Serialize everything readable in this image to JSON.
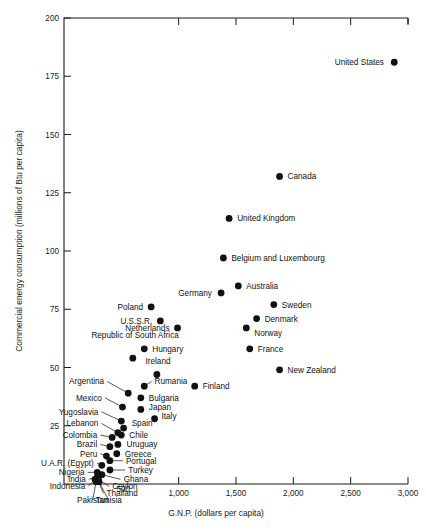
{
  "chart_data": {
    "type": "scatter",
    "title": "",
    "xlabel": "G.N.P. (dollars per capita)",
    "ylabel": "Commercial energy consumption   (millions of Btu per capita)",
    "xlim": [
      0,
      3000
    ],
    "ylim": [
      0,
      200
    ],
    "xticks": [
      500,
      1000,
      1500,
      2000,
      2500,
      3000
    ],
    "xticklabels": [
      "500",
      "1,000",
      "1,500",
      "2,000",
      "2,500",
      "3,000"
    ],
    "yticks": [
      25,
      50,
      75,
      100,
      125,
      150,
      175,
      200
    ],
    "yticklabels": [
      "25",
      "50",
      "75",
      "100",
      "125",
      "150",
      "175",
      "200"
    ],
    "grid": false,
    "legend": "none",
    "points": [
      {
        "name": "United States",
        "x": 2880,
        "y": 181,
        "lx": 2790,
        "ly": 181,
        "anchor": "end",
        "leader": false
      },
      {
        "name": "Canada",
        "x": 1880,
        "y": 132,
        "lx": 1950,
        "ly": 132,
        "anchor": "start",
        "leader": false
      },
      {
        "name": "United Kingdom",
        "x": 1440,
        "y": 114,
        "lx": 1510,
        "ly": 114,
        "anchor": "start",
        "leader": false
      },
      {
        "name": "Belgium and Luxembourg",
        "x": 1390,
        "y": 97,
        "lx": 1460,
        "ly": 97,
        "anchor": "start",
        "leader": false
      },
      {
        "name": "Australia",
        "x": 1520,
        "y": 85,
        "lx": 1590,
        "ly": 85,
        "anchor": "start",
        "leader": false
      },
      {
        "name": "Germany",
        "x": 1370,
        "y": 82,
        "lx": 1290,
        "ly": 82,
        "anchor": "end",
        "leader": false
      },
      {
        "name": "Sweden",
        "x": 1830,
        "y": 77,
        "lx": 1900,
        "ly": 77,
        "anchor": "start",
        "leader": false
      },
      {
        "name": "Poland",
        "x": 760,
        "y": 76,
        "lx": 690,
        "ly": 76,
        "anchor": "end",
        "leader": false
      },
      {
        "name": "U.S.S.R.",
        "x": 840,
        "y": 70,
        "lx": 770,
        "ly": 70,
        "anchor": "end",
        "leader": false
      },
      {
        "name": "Denmark",
        "x": 1680,
        "y": 71,
        "lx": 1750,
        "ly": 71,
        "anchor": "start",
        "leader": false
      },
      {
        "name": "Netherlands",
        "x": 990,
        "y": 67,
        "lx": 920,
        "ly": 67,
        "anchor": "end",
        "leader": false
      },
      {
        "name": "Norway",
        "x": 1590,
        "y": 67,
        "lx": 1660,
        "ly": 65,
        "anchor": "start",
        "leader": false
      },
      {
        "name": "Republic of South Africa",
        "x": 600,
        "y": 54,
        "lx": 620,
        "ly": 64,
        "anchor": "middle",
        "leader": false
      },
      {
        "name": "Hungary",
        "x": 700,
        "y": 58,
        "lx": 770,
        "ly": 58,
        "anchor": "start",
        "leader": false
      },
      {
        "name": "France",
        "x": 1620,
        "y": 58,
        "lx": 1690,
        "ly": 58,
        "anchor": "start",
        "leader": false
      },
      {
        "name": "Ireland",
        "x": 810,
        "y": 47,
        "lx": 820,
        "ly": 53,
        "anchor": "middle",
        "leader": false
      },
      {
        "name": "New Zealand",
        "x": 1880,
        "y": 49,
        "lx": 1950,
        "ly": 49,
        "anchor": "start",
        "leader": false
      },
      {
        "name": "Finland",
        "x": 1140,
        "y": 42,
        "lx": 1210,
        "ly": 42,
        "anchor": "start",
        "leader": false
      },
      {
        "name": "Rumania",
        "x": 700,
        "y": 42,
        "lx": 790,
        "ly": 44,
        "anchor": "start",
        "leader": true
      },
      {
        "name": "Bulgaria",
        "x": 670,
        "y": 37,
        "lx": 740,
        "ly": 37,
        "anchor": "start",
        "leader": false
      },
      {
        "name": "Argentina",
        "x": 560,
        "y": 39,
        "lx": 350,
        "ly": 44,
        "anchor": "end",
        "leader": true
      },
      {
        "name": "Japan",
        "x": 670,
        "y": 32,
        "lx": 740,
        "ly": 33,
        "anchor": "start",
        "leader": false
      },
      {
        "name": "Mexico",
        "x": 510,
        "y": 33,
        "lx": 330,
        "ly": 37,
        "anchor": "end",
        "leader": true
      },
      {
        "name": "Italy",
        "x": 790,
        "y": 28,
        "lx": 850,
        "ly": 29,
        "anchor": "start",
        "leader": false
      },
      {
        "name": "Yugoslavia",
        "x": 500,
        "y": 27,
        "lx": 300,
        "ly": 31,
        "anchor": "end",
        "leader": true
      },
      {
        "name": "Spain",
        "x": 520,
        "y": 24,
        "lx": 590,
        "ly": 26,
        "anchor": "start",
        "leader": false
      },
      {
        "name": "Lebanon",
        "x": 470,
        "y": 22,
        "lx": 300,
        "ly": 26,
        "anchor": "end",
        "leader": true
      },
      {
        "name": "Chile",
        "x": 500,
        "y": 21,
        "lx": 570,
        "ly": 21,
        "anchor": "start",
        "leader": false
      },
      {
        "name": "Colombia",
        "x": 420,
        "y": 20,
        "lx": 290,
        "ly": 21,
        "anchor": "end",
        "leader": true
      },
      {
        "name": "Uruguay",
        "x": 470,
        "y": 17,
        "lx": 545,
        "ly": 17,
        "anchor": "start",
        "leader": false
      },
      {
        "name": "Brazil",
        "x": 400,
        "y": 16,
        "lx": 290,
        "ly": 17,
        "anchor": "end",
        "leader": true
      },
      {
        "name": "Greece",
        "x": 460,
        "y": 13,
        "lx": 530,
        "ly": 13,
        "anchor": "start",
        "leader": false
      },
      {
        "name": "Peru",
        "x": 370,
        "y": 12,
        "lx": 290,
        "ly": 13,
        "anchor": "end",
        "leader": true
      },
      {
        "name": "Portugal",
        "x": 400,
        "y": 10,
        "lx": 540,
        "ly": 10,
        "anchor": "start",
        "leader": true
      },
      {
        "name": "U.A.R. (Egypt)",
        "x": 330,
        "y": 8,
        "lx": 260,
        "ly": 9,
        "anchor": "end",
        "leader": true
      },
      {
        "name": "Turkey",
        "x": 400,
        "y": 6,
        "lx": 560,
        "ly": 6,
        "anchor": "start",
        "leader": true
      },
      {
        "name": "Nigeria",
        "x": 290,
        "y": 5,
        "lx": 180,
        "ly": 5,
        "anchor": "end",
        "leader": true
      },
      {
        "name": "Ghana",
        "x": 330,
        "y": 4,
        "lx": 520,
        "ly": 2,
        "anchor": "start",
        "leader": true
      },
      {
        "name": "India",
        "x": 290,
        "y": 3,
        "lx": 190,
        "ly": 2,
        "anchor": "end",
        "leader": true
      },
      {
        "name": "Ceylon",
        "x": 300,
        "y": 2,
        "lx": 420,
        "ly": -1,
        "anchor": "start",
        "leader": true
      },
      {
        "name": "Indonesia",
        "x": 270,
        "y": 2,
        "lx": 185,
        "ly": -1,
        "anchor": "end",
        "leader": true
      },
      {
        "name": "Thailand",
        "x": 300,
        "y": 1,
        "lx": 370,
        "ly": -4,
        "anchor": "start",
        "leader": true
      },
      {
        "name": "Pakistan",
        "x": 280,
        "y": 1,
        "lx": 250,
        "ly": -7,
        "anchor": "middle",
        "leader": true
      },
      {
        "name": "Tunisia",
        "x": 305,
        "y": 1,
        "lx": 390,
        "ly": -7,
        "anchor": "middle",
        "leader": true
      }
    ]
  }
}
